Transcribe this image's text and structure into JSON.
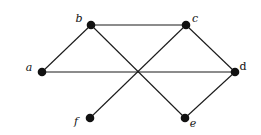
{
  "graph": {
    "directed": false,
    "colors": {
      "node": "#111111",
      "edge": "#1a1a1a",
      "background": "#ffffff"
    },
    "nodes": [
      {
        "id": "a",
        "label": "a",
        "italic": true
      },
      {
        "id": "b",
        "label": "b",
        "italic": true
      },
      {
        "id": "c",
        "label": "c",
        "italic": true
      },
      {
        "id": "d",
        "label": "d",
        "italic": false
      },
      {
        "id": "e",
        "label": "e",
        "italic": true
      },
      {
        "id": "f",
        "label": "f",
        "italic": true
      }
    ],
    "edges": [
      [
        "a",
        "b"
      ],
      [
        "b",
        "c"
      ],
      [
        "c",
        "d"
      ],
      [
        "a",
        "d"
      ],
      [
        "b",
        "e"
      ],
      [
        "c",
        "f"
      ],
      [
        "d",
        "e"
      ]
    ]
  }
}
